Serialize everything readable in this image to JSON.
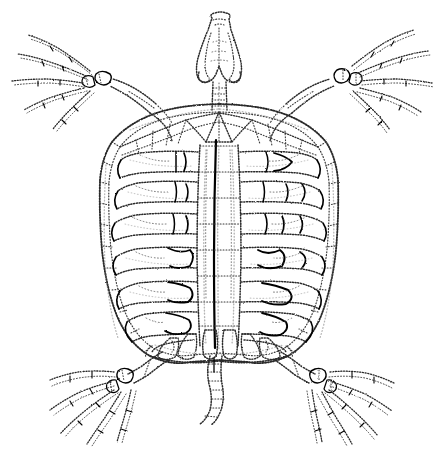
{
  "image": {
    "subject": "turtle skeleton",
    "view": "dorsal view of carapace with head, four limbs and tail",
    "style": "vintage stipple engraving line drawing",
    "background_color": "#ffffff",
    "ink_color": "#1a1a1a",
    "width_px": 443,
    "height_px": 450
  },
  "anatomy": {
    "skull": {
      "label": "skull",
      "center_x": 219,
      "top_y": 14,
      "width": 46,
      "height": 72
    },
    "neck": {
      "label": "cervical vertebrae",
      "center_x": 219,
      "top_y": 82,
      "bottom_y": 112,
      "segments": 5
    },
    "carapace": {
      "label": "carapace",
      "left_x": 100,
      "right_x": 340,
      "top_y": 104,
      "bottom_y": 360,
      "neural_plates": 8,
      "costal_rib_pairs": 8,
      "marginal_plates_per_side": 11
    },
    "pectoral_girdle": {
      "label": "pectoral girdle",
      "left_x": 133,
      "right_x": 307,
      "y": 118
    },
    "pelvic_girdle": {
      "label": "pelvic girdle",
      "center_x": 219,
      "y": 336
    },
    "tail": {
      "label": "caudal vertebrae",
      "center_x": 213,
      "top_y": 352,
      "bottom_y": 424,
      "segments": 9
    },
    "limbs": [
      {
        "name": "front-left-limb",
        "position": "upper-left",
        "wrist_x": 96,
        "wrist_y": 76,
        "digits": 5,
        "direction": "upper-left"
      },
      {
        "name": "front-right-limb",
        "position": "upper-right",
        "wrist_x": 348,
        "wrist_y": 72,
        "digits": 5,
        "direction": "upper-right"
      },
      {
        "name": "rear-left-limb",
        "position": "lower-left",
        "wrist_x": 130,
        "wrist_y": 374,
        "digits": 5,
        "direction": "lower-left"
      },
      {
        "name": "rear-right-limb",
        "position": "lower-right",
        "wrist_x": 323,
        "wrist_y": 374,
        "digits": 5,
        "direction": "lower-right"
      }
    ]
  },
  "caption": ""
}
